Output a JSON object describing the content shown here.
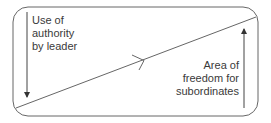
{
  "diagram": {
    "type": "leadership-continuum",
    "left_label": [
      "Use of",
      "authority",
      "by leader"
    ],
    "right_label": [
      "Area of",
      "freedom for",
      "subordinates"
    ],
    "colors": {
      "stroke": "#555555",
      "text": "#3a3a3a",
      "background": "#ffffff"
    },
    "arrows": {
      "left": "down",
      "right": "up",
      "diagonal": "right"
    }
  }
}
